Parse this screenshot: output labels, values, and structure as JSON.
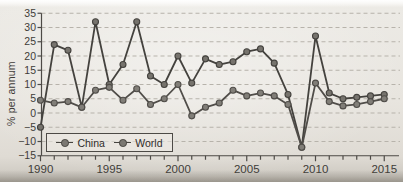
{
  "figure": {
    "kind": "photographed book figure of a line chart",
    "background_color": "#e8e5df",
    "text_color": "#3e3c38"
  },
  "chart_data": {
    "type": "line",
    "title": "",
    "xlabel": "",
    "ylabel": "% per annum",
    "x": [
      1990,
      1991,
      1992,
      1993,
      1994,
      1995,
      1996,
      1997,
      1998,
      1999,
      2000,
      2001,
      2002,
      2003,
      2004,
      2005,
      2006,
      2007,
      2008,
      2009,
      2010,
      2011,
      2012,
      2013,
      2014,
      2015
    ],
    "series": [
      {
        "name": "China",
        "line_color": "#44423e",
        "marker_color": "#76736d",
        "values": [
          -5,
          24,
          22,
          2,
          32,
          10,
          17,
          32,
          13,
          10,
          20,
          10.5,
          19,
          17,
          18,
          21.5,
          22.5,
          17.5,
          6.5,
          -12,
          27,
          7,
          5,
          5.5,
          6,
          6.5
        ]
      },
      {
        "name": "World",
        "line_color": "#504d49",
        "marker_color": "#817e78",
        "values": [
          4.5,
          3.5,
          4,
          2,
          8,
          9,
          4.5,
          8.5,
          3,
          5,
          10,
          -1,
          2,
          3.5,
          8,
          6,
          7,
          6,
          3,
          -12,
          10.5,
          4,
          2.5,
          3,
          4,
          5
        ]
      }
    ],
    "ylim": [
      -15,
      35
    ],
    "xlim": [
      1990,
      2015
    ],
    "yticks": [
      35,
      30,
      25,
      20,
      15,
      10,
      5,
      0,
      -5,
      -10,
      -15
    ],
    "xticks": [
      1990,
      1995,
      2000,
      2005,
      2010,
      2015
    ],
    "minor_x_ticks_every_year": true,
    "grid": "horizontal dashed",
    "grid_color": "#b7b3ab",
    "legend_position": "inside bottom-left, boxed",
    "marker": "filled circle"
  }
}
